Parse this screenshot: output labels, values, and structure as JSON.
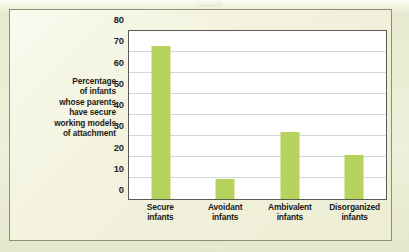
{
  "figure": {
    "background_color": "#f2f2dc",
    "frame_border_color": "#8d8f79",
    "plot_background_color": "#ffffff",
    "plot_border_color": "#5b5b52",
    "gridline_color": "#d5d7dd",
    "bar_color": "#b6d45d"
  },
  "y_axis_title": {
    "lines": [
      "Percentage",
      "of infants",
      "whose parents",
      "have secure",
      "working models",
      "of attachment"
    ]
  },
  "chart_data": {
    "type": "bar",
    "title": "",
    "subtitle": "",
    "xlabel": "",
    "ylabel": "Percentage of infants whose parents have secure working models of attachment",
    "categories": [
      "Secure infants",
      "Avoidant infants",
      "Ambivalent infants",
      "Disorganized infants"
    ],
    "category_lines": [
      [
        "Secure",
        "infants"
      ],
      [
        "Avoidant",
        "infants"
      ],
      [
        "Ambivalent",
        "infants"
      ],
      [
        "Disorganized",
        "infants"
      ]
    ],
    "values": [
      73,
      9.5,
      32,
      21
    ],
    "ylim": [
      0,
      80
    ],
    "yticks": [
      0,
      10,
      20,
      30,
      40,
      50,
      60,
      70,
      80
    ],
    "ytick_labels": [
      "0",
      "10",
      "20",
      "30",
      "40",
      "50",
      "60",
      "70",
      "80"
    ],
    "grid": true,
    "grid_axis": "y",
    "legend": false,
    "legend_position": "none",
    "bar_color": "#b6d45d",
    "series": [
      {
        "name": "Percentage of infants whose parents have secure working models of attachment",
        "values": [
          73,
          9.5,
          32,
          21
        ]
      }
    ]
  }
}
